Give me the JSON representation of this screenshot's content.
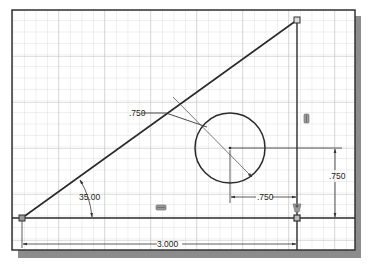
{
  "sketch": {
    "title": "Sketch canvas with dimensioned triangle and circle",
    "colors": {
      "background": "#ffffff",
      "grid_minor": "#d4d4d4",
      "grid_major": "#b8b8b8",
      "frame": "#333333",
      "shadow": "#8a8a8a",
      "geometry": "#2a2a2a",
      "dimension": "#333333"
    },
    "dimensions": {
      "diameter_leader": ".750",
      "horizontal_offset": ".750",
      "vertical_offset": ".750",
      "angle": "35.00",
      "base_length": "3.000"
    },
    "constraints": [
      {
        "name": "vertical-constraint-icon",
        "label": "vertical"
      },
      {
        "name": "horizontal-constraint-icon",
        "label": "horizontal"
      },
      {
        "name": "coincident-constraint-icon",
        "label": "coincident"
      }
    ]
  }
}
